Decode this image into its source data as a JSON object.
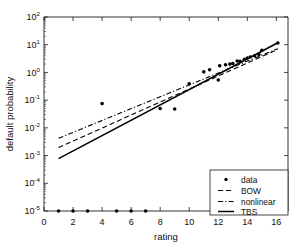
{
  "chart_data": {
    "type": "scatter",
    "title": "",
    "xlabel": "rating",
    "ylabel": "default probability",
    "xlim": [
      0,
      16.8
    ],
    "ylim_log10": [
      -5,
      2
    ],
    "yscale": "log",
    "xscale": "linear",
    "grid": false,
    "legend_position": "lower right",
    "xticks": [
      0,
      2,
      4,
      6,
      8,
      10,
      12,
      14,
      16
    ],
    "xticklabels": [
      "0",
      "2",
      "4",
      "6",
      "8",
      "10",
      "12",
      "14",
      "16"
    ],
    "yticks_exponent": [
      2,
      1,
      0,
      -1,
      -2,
      -3,
      -4,
      -5
    ],
    "yticklabels": [
      "10^2",
      "10^1",
      "10^0",
      "10^-1",
      "10^-2",
      "10^-3",
      "10^-4",
      "10^-5"
    ],
    "ytick_base": "10",
    "series": [
      {
        "name": "data",
        "type": "scatter",
        "marker": "circle",
        "color": "#000000",
        "points": [
          {
            "x": 1,
            "y": 1e-05
          },
          {
            "x": 2,
            "y": 1e-05
          },
          {
            "x": 3,
            "y": 1e-05
          },
          {
            "x": 5,
            "y": 1e-05
          },
          {
            "x": 6,
            "y": 1e-05
          },
          {
            "x": 7,
            "y": 1e-05
          },
          {
            "x": 4,
            "y": 0.075
          },
          {
            "x": 8,
            "y": 0.05
          },
          {
            "x": 9,
            "y": 0.048
          },
          {
            "x": 10,
            "y": 0.39
          },
          {
            "x": 11,
            "y": 1.05
          },
          {
            "x": 11.4,
            "y": 1.25
          },
          {
            "x": 12,
            "y": 0.53
          },
          {
            "x": 12.1,
            "y": 1.75
          },
          {
            "x": 12.5,
            "y": 1.9
          },
          {
            "x": 12.8,
            "y": 2.0
          },
          {
            "x": 13.0,
            "y": 2.1
          },
          {
            "x": 13.3,
            "y": 2.6
          },
          {
            "x": 13.5,
            "y": 2.5
          },
          {
            "x": 13.8,
            "y": 3.0
          },
          {
            "x": 14.0,
            "y": 3.3
          },
          {
            "x": 14.2,
            "y": 3.6
          },
          {
            "x": 14.5,
            "y": 4.0
          },
          {
            "x": 14.8,
            "y": 4.4
          },
          {
            "x": 15.0,
            "y": 6.3
          },
          {
            "x": 16.1,
            "y": 11.5
          }
        ]
      },
      {
        "name": "BOW",
        "type": "line",
        "style": "dashed",
        "color": "#000000",
        "points": [
          {
            "x": 1.0,
            "y": 0.00195
          },
          {
            "x": 16.1,
            "y": 6.8
          }
        ]
      },
      {
        "name": "nonlinear",
        "type": "line",
        "style": "dashdot",
        "color": "#000000",
        "points": [
          {
            "x": 1.0,
            "y": 0.0042
          },
          {
            "x": 16.1,
            "y": 7.2
          }
        ]
      },
      {
        "name": "TBS",
        "type": "line",
        "style": "solid",
        "color": "#000000",
        "points": [
          {
            "x": 1.0,
            "y": 0.00078
          },
          {
            "x": 16.1,
            "y": 11.8
          }
        ]
      }
    ]
  },
  "legend": {
    "entries": [
      {
        "label": "data",
        "marker": "dot"
      },
      {
        "label": "BOW",
        "marker": "dashed-line"
      },
      {
        "label": "nonlinear",
        "marker": "dashdot-line"
      },
      {
        "label": "TBS",
        "marker": "solid-line"
      }
    ]
  },
  "axes": {
    "xlabel": "rating",
    "ylabel": "default probability"
  }
}
